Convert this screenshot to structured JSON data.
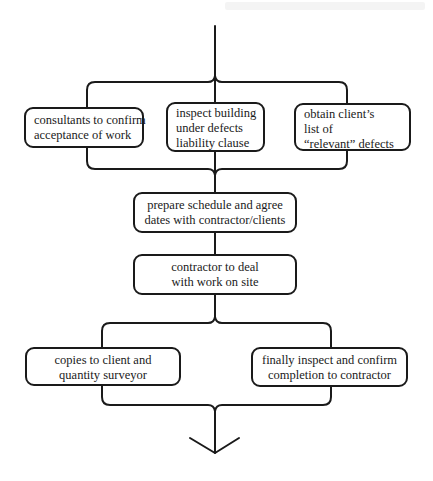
{
  "diagram": {
    "type": "flowchart",
    "colors": {
      "line": "#1a1a1a",
      "background": "#ffffff"
    },
    "parallel_group_1": [
      {
        "id": "b1",
        "lines": [
          "consultants to confirm",
          "acceptance of work"
        ]
      },
      {
        "id": "b2",
        "lines": [
          "inspect building",
          "under defects",
          "liability clause"
        ]
      },
      {
        "id": "b3",
        "lines": [
          "obtain client’s",
          "list of",
          "“relevant” defects"
        ]
      }
    ],
    "sequence": [
      {
        "id": "b4",
        "lines": [
          "prepare schedule and agree",
          "dates with contractor/clients"
        ]
      },
      {
        "id": "b5",
        "lines": [
          "contractor to deal",
          "with work on site"
        ]
      }
    ],
    "parallel_group_2": [
      {
        "id": "b6",
        "lines": [
          "copies to client and",
          "quantity surveyor"
        ]
      },
      {
        "id": "b7",
        "lines": [
          "finally inspect  and confirm",
          "completion  to contractor"
        ]
      }
    ],
    "edges": [
      [
        "start",
        "b1"
      ],
      [
        "start",
        "b2"
      ],
      [
        "start",
        "b3"
      ],
      [
        "b1",
        "b4"
      ],
      [
        "b2",
        "b4"
      ],
      [
        "b3",
        "b4"
      ],
      [
        "b4",
        "b5"
      ],
      [
        "b5",
        "b6"
      ],
      [
        "b5",
        "b7"
      ],
      [
        "b6",
        "end"
      ],
      [
        "b7",
        "end"
      ]
    ],
    "end_marker": "open-arrow-down"
  }
}
